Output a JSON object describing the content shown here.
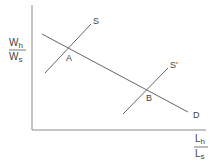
{
  "diagram": {
    "type": "supply-demand",
    "y_axis_label": {
      "numerator": "W",
      "numerator_sub": "h",
      "denominator": "W",
      "denominator_sub": "s"
    },
    "x_axis_label": {
      "numerator": "L",
      "numerator_sub": "h",
      "denominator": "L",
      "denominator_sub": "s"
    },
    "curves": [
      {
        "id": "S",
        "label": "S",
        "kind": "supply"
      },
      {
        "id": "S_prime",
        "label": "S'",
        "kind": "supply-shifted"
      },
      {
        "id": "D",
        "label": "D",
        "kind": "demand"
      }
    ],
    "points": [
      {
        "id": "A",
        "label": "A",
        "between": [
          "S",
          "D"
        ]
      },
      {
        "id": "B",
        "label": "B",
        "between": [
          "S_prime",
          "D"
        ]
      }
    ],
    "colors": {
      "line": "#666666",
      "axis": "#888888",
      "text": "#444444"
    }
  }
}
